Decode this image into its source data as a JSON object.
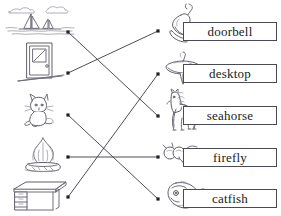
{
  "worksheet": {
    "title": "compound-word matching worksheet",
    "width": 281,
    "height": 216,
    "ink_color": "#6f6f7a",
    "line_color": "#3a3a44",
    "dot_color": "#1e1e26",
    "box_border_color": "#4a4a55",
    "background": "#ffffff"
  },
  "left_column": {
    "items": [
      {
        "index": 1,
        "icon": "sea-with-sailboats-icon",
        "name": "sea",
        "dot": {
          "x": 68,
          "y": 32
        }
      },
      {
        "index": 2,
        "icon": "door-icon",
        "name": "door",
        "dot": {
          "x": 68,
          "y": 73
        }
      },
      {
        "index": 3,
        "icon": "cat-icon",
        "name": "cat",
        "dot": {
          "x": 68,
          "y": 115
        }
      },
      {
        "index": 4,
        "icon": "fire-icon",
        "name": "fire",
        "dot": {
          "x": 68,
          "y": 157
        }
      },
      {
        "index": 5,
        "icon": "desk-icon",
        "name": "desk",
        "dot": {
          "x": 68,
          "y": 197
        }
      }
    ]
  },
  "right_column": {
    "items": [
      {
        "index": 1,
        "icon": "bell-icon",
        "label": "doorbell",
        "dot": {
          "x": 158,
          "y": 31
        }
      },
      {
        "index": 2,
        "icon": "spinning-top-icon",
        "label": "desktop",
        "dot": {
          "x": 158,
          "y": 74
        }
      },
      {
        "index": 3,
        "icon": "horse-icon",
        "label": "seahorse",
        "dot": {
          "x": 158,
          "y": 116
        }
      },
      {
        "index": 4,
        "icon": "fly-icon",
        "label": "firefly",
        "dot": {
          "x": 158,
          "y": 157
        }
      },
      {
        "index": 5,
        "icon": "fish-icon",
        "label": "catfish",
        "dot": {
          "x": 158,
          "y": 199
        }
      }
    ]
  },
  "connections": [
    {
      "from": "sea",
      "to": "seahorse",
      "x1": 68,
      "y1": 32,
      "x2": 158,
      "y2": 116
    },
    {
      "from": "door",
      "to": "doorbell",
      "x1": 68,
      "y1": 73,
      "x2": 158,
      "y2": 31
    },
    {
      "from": "cat",
      "to": "catfish",
      "x1": 68,
      "y1": 115,
      "x2": 158,
      "y2": 199
    },
    {
      "from": "fire",
      "to": "firefly",
      "x1": 68,
      "y1": 157,
      "x2": 158,
      "y2": 157
    },
    {
      "from": "desk",
      "to": "desktop",
      "x1": 68,
      "y1": 197,
      "x2": 158,
      "y2": 74
    }
  ]
}
